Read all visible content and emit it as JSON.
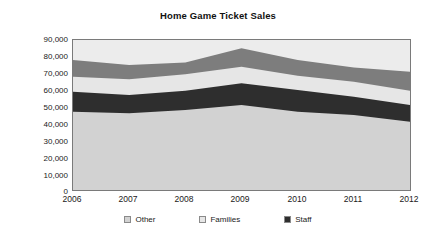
{
  "chart_data": {
    "type": "area",
    "stacked": true,
    "title": "Home Game Ticket Sales",
    "xlabel": "",
    "ylabel": "Average per Game",
    "categories": [
      "2006",
      "2007",
      "2008",
      "2009",
      "2010",
      "2011",
      "2012"
    ],
    "x": [
      2006,
      2007,
      2008,
      2009,
      2010,
      2011,
      2012
    ],
    "ylim": [
      0,
      90000
    ],
    "yticks": [
      0,
      10000,
      20000,
      30000,
      40000,
      50000,
      60000,
      70000,
      80000,
      90000
    ],
    "ytick_labels": [
      "0",
      "10,000",
      "20,000",
      "30,000",
      "40,000",
      "50,000",
      "60,000",
      "70,000",
      "80,000",
      "90,000"
    ],
    "grid": false,
    "legend_position": "bottom",
    "series": [
      {
        "name": "Other",
        "color": "#d2d2d2",
        "values": [
          47000,
          46000,
          48000,
          51000,
          47000,
          45000,
          41000
        ],
        "cumulative_top": [
          47000,
          46000,
          48000,
          51000,
          47000,
          45000,
          41000
        ]
      },
      {
        "name": "Staff",
        "color": "#2e2e2e",
        "values": [
          12000,
          11000,
          11500,
          13000,
          13000,
          11000,
          10000
        ],
        "cumulative_top": [
          59000,
          57000,
          59500,
          64000,
          60000,
          56000,
          51000
        ]
      },
      {
        "name": "Families",
        "color": "#e6e6e6",
        "values": [
          9000,
          9500,
          10000,
          10000,
          8500,
          9000,
          8500
        ],
        "cumulative_top": [
          68000,
          66500,
          69500,
          74000,
          68500,
          65000,
          59500
        ]
      },
      {
        "name": "Season",
        "color": "#7d7d7d",
        "values": [
          10000,
          8500,
          7000,
          11000,
          9500,
          8500,
          11500
        ],
        "cumulative_top": [
          78000,
          75000,
          76500,
          85000,
          78000,
          73500,
          71000
        ]
      }
    ],
    "totals": [
      78000,
      75000,
      76500,
      85000,
      78000,
      73500,
      71000
    ]
  },
  "legend": {
    "items": [
      {
        "label": "Other",
        "color": "#d2d2d2"
      },
      {
        "label": "Families",
        "color": "#e6e6e6"
      },
      {
        "label": "Staff",
        "color": "#2e2e2e"
      }
    ]
  },
  "colors": {
    "plot_background": "#ececec",
    "axis_line": "#7a7a7a",
    "text": "#1a1a1a"
  }
}
